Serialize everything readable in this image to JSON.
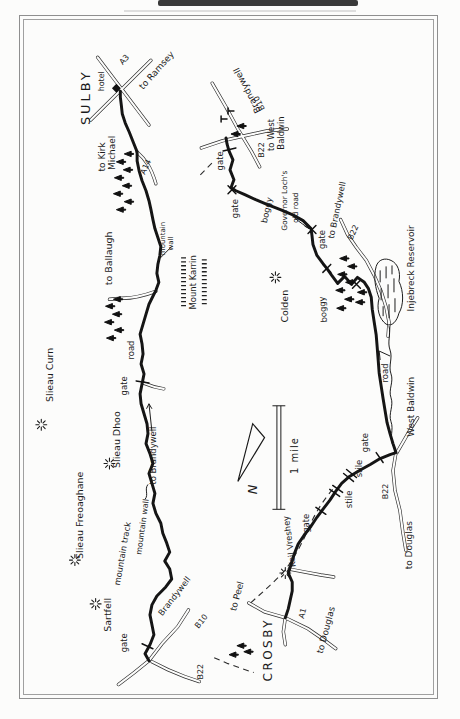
{
  "colors": {
    "ink": "#1b1b1b",
    "road_gray": "#2e2e2e",
    "paper": "#fcfcfb"
  },
  "labels": [
    {
      "text": "SULBY"
    },
    {
      "text": "hotel"
    },
    {
      "text": "A3"
    },
    {
      "text": "to Ramsey"
    },
    {
      "text": "to Kirk"
    },
    {
      "text": "Michael"
    },
    {
      "text": "A14"
    },
    {
      "text": "to Ballaugh"
    },
    {
      "text": "mountain"
    },
    {
      "text": "wall"
    },
    {
      "text": "Mount Karrin"
    },
    {
      "text": "Slieau Curn"
    },
    {
      "text": "road"
    },
    {
      "text": "gate"
    },
    {
      "text": "Slieau Dhoo"
    },
    {
      "text": "to Brandywell"
    },
    {
      "text": "mountain wall"
    },
    {
      "text": "Slieau Freoaghane"
    },
    {
      "text": "mountain track"
    },
    {
      "text": "Sartfell"
    },
    {
      "text": "gate"
    },
    {
      "text": "Brandywell"
    },
    {
      "text": "B10"
    },
    {
      "text": "B22"
    },
    {
      "text": "CROSBY"
    },
    {
      "text": "to Peel"
    },
    {
      "text": "A1"
    },
    {
      "text": "to Douglas"
    },
    {
      "text": "Keil Vreshey"
    },
    {
      "text": "gate"
    },
    {
      "text": "stile"
    },
    {
      "text": "stile"
    },
    {
      "text": "gate"
    },
    {
      "text": "West Baldwin"
    },
    {
      "text": "B22"
    },
    {
      "text": "to Douglas"
    },
    {
      "text": "road"
    },
    {
      "text": "Injebreck Reservoir"
    },
    {
      "text": "boggy"
    },
    {
      "text": "Colden"
    },
    {
      "text": "boggy"
    },
    {
      "text": "Governor Loch's"
    },
    {
      "text": "old road"
    },
    {
      "text": "gate"
    },
    {
      "text": "to Brandywell"
    },
    {
      "text": "B22"
    },
    {
      "text": "gate"
    },
    {
      "text": "gate"
    },
    {
      "text": "Brandywell"
    },
    {
      "text": "B10"
    },
    {
      "text": "B22"
    },
    {
      "text": "to West"
    },
    {
      "text": "Baldwin"
    },
    {
      "text": "N"
    },
    {
      "text": "1 mile"
    }
  ]
}
